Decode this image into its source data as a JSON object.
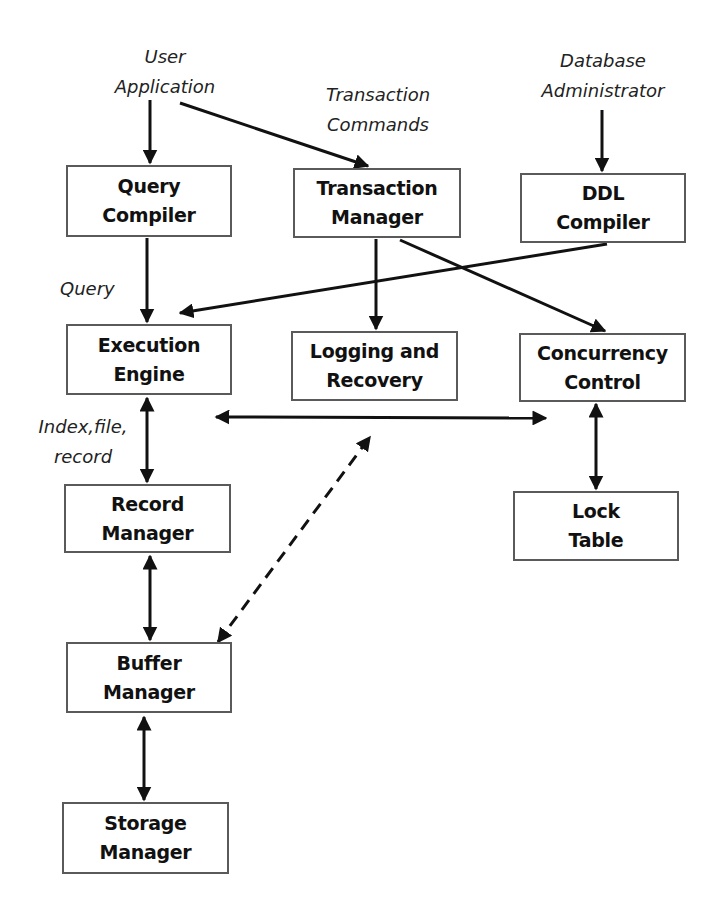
{
  "diagram": {
    "actors": {
      "user_app": {
        "line1": "User",
        "line2": "Application"
      },
      "txn_commands": {
        "line1": "Transaction",
        "line2": "Commands"
      },
      "dba": {
        "line1": "Database",
        "line2": "Administrator"
      }
    },
    "edge_labels": {
      "query": "Query",
      "index_line1": "Index,file,",
      "index_line2": "record"
    },
    "components": {
      "query_compiler": {
        "line1": "Query",
        "line2": "Compiler"
      },
      "transaction_manager": {
        "line1": "Transaction",
        "line2": "Manager"
      },
      "ddl_compiler": {
        "line1": "DDL",
        "line2": "Compiler"
      },
      "execution_engine": {
        "line1": "Execution",
        "line2": "Engine"
      },
      "logging_recovery": {
        "line1": "Logging and",
        "line2": "Recovery"
      },
      "concurrency_control": {
        "line1": "Concurrency",
        "line2": "Control"
      },
      "record_manager": {
        "line1": "Record",
        "line2": "Manager"
      },
      "lock_table": {
        "line1": "Lock",
        "line2": "Table"
      },
      "buffer_manager": {
        "line1": "Buffer",
        "line2": "Manager"
      },
      "storage_manager": {
        "line1": "Storage",
        "line2": "Manager"
      }
    },
    "edges": [
      {
        "from": "User Application",
        "to": "Query Compiler",
        "style": "solid",
        "direction": "single"
      },
      {
        "from": "User Application",
        "to": "Transaction Manager",
        "style": "solid",
        "direction": "single"
      },
      {
        "from": "Database Administrator",
        "to": "DDL Compiler",
        "style": "solid",
        "direction": "single"
      },
      {
        "from": "Query Compiler",
        "to": "Execution Engine",
        "style": "solid",
        "direction": "single",
        "label": "Query"
      },
      {
        "from": "DDL Compiler",
        "to": "Execution Engine",
        "style": "solid",
        "direction": "single"
      },
      {
        "from": "Transaction Manager",
        "to": "Logging and Recovery",
        "style": "solid",
        "direction": "single"
      },
      {
        "from": "Transaction Manager",
        "to": "Concurrency Control",
        "style": "solid",
        "direction": "single"
      },
      {
        "from": "Execution Engine",
        "to": "Concurrency Control",
        "style": "solid",
        "direction": "double"
      },
      {
        "from": "Execution Engine",
        "to": "Record Manager",
        "style": "solid",
        "direction": "double",
        "label": "Index,file, record"
      },
      {
        "from": "Concurrency Control",
        "to": "Lock Table",
        "style": "solid",
        "direction": "double"
      },
      {
        "from": "Record Manager",
        "to": "Buffer Manager",
        "style": "solid",
        "direction": "double"
      },
      {
        "from": "Buffer Manager",
        "to": "Logging and Recovery",
        "style": "dashed",
        "direction": "double"
      },
      {
        "from": "Buffer Manager",
        "to": "Storage Manager",
        "style": "solid",
        "direction": "double"
      }
    ],
    "colors": {
      "line": "#111111",
      "box_border": "#5a5a5a",
      "background": "#ffffff"
    }
  }
}
